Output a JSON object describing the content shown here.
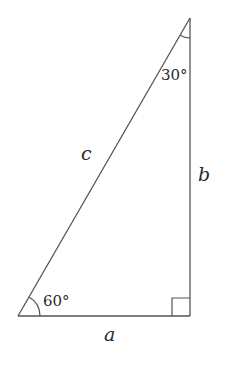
{
  "diagram": {
    "type": "right-triangle",
    "stroke_color": "#555555",
    "vertices": {
      "bottom_left": [
        18,
        316
      ],
      "bottom_right": [
        190,
        316
      ],
      "top": [
        190,
        18
      ]
    },
    "sides": {
      "hypotenuse": {
        "label": "c"
      },
      "vertical": {
        "label": "b"
      },
      "horizontal": {
        "label": "a"
      }
    },
    "angles": {
      "top": {
        "label": "30°"
      },
      "bottom_left": {
        "label": "60°"
      },
      "bottom_right": {
        "label": "right-angle-marker"
      }
    }
  }
}
